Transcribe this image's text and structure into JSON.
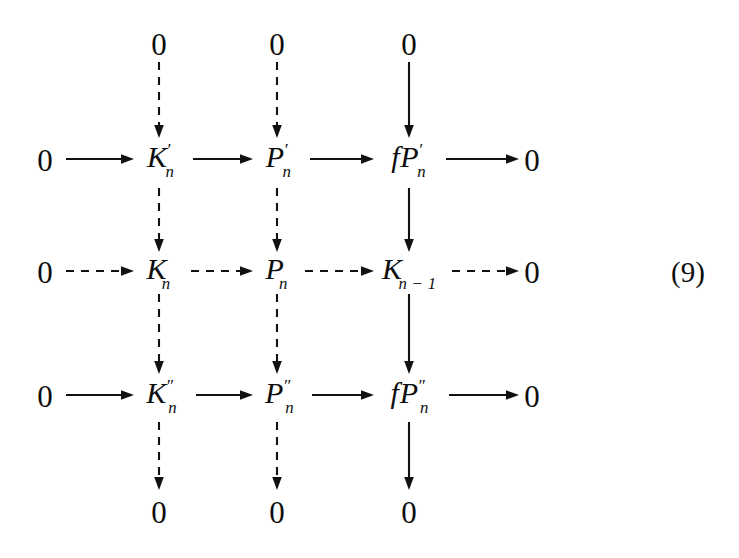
{
  "figure": {
    "kind": "commutative-diagram",
    "equation_tag": "(9)",
    "background_color": "#ffffff",
    "ink_color": "#111111",
    "width": 739,
    "height": 558
  },
  "columns": [
    {
      "id": "col-1",
      "x": 159
    },
    {
      "id": "col-2",
      "x": 277
    },
    {
      "id": "col-3",
      "x": 409
    }
  ],
  "rows": [
    {
      "id": "row-top-zero",
      "y": 44
    },
    {
      "id": "row-1",
      "y": 160,
      "arrow_style": "solid"
    },
    {
      "id": "row-2",
      "y": 272,
      "arrow_style": "dashed"
    },
    {
      "id": "row-3",
      "y": 396,
      "arrow_style": "solid"
    },
    {
      "id": "row-bottom-zero",
      "y": 512
    }
  ],
  "nodes": {
    "top_zeros": [
      {
        "label": "0",
        "col": 0
      },
      {
        "label": "0",
        "col": 1
      },
      {
        "label": "0",
        "col": 2
      }
    ],
    "bottom_zeros": [
      {
        "label": "0",
        "col": 0
      },
      {
        "label": "0",
        "col": 1
      },
      {
        "label": "0",
        "col": 2
      }
    ],
    "row1": {
      "left_zero": "0",
      "right_zero": "0",
      "terms": [
        {
          "base": "K",
          "sup": "′",
          "sub": "n"
        },
        {
          "base": "P",
          "sup": "′",
          "sub": "n"
        },
        {
          "prefix": "f",
          "base": "P",
          "sup": "′",
          "sub": "n"
        }
      ]
    },
    "row2": {
      "left_zero": "0",
      "right_zero": "0",
      "terms": [
        {
          "base": "K",
          "sup": "",
          "sub": "n"
        },
        {
          "base": "P",
          "sup": "",
          "sub": "n"
        },
        {
          "base": "K",
          "sup": "",
          "sub": "n − 1"
        }
      ]
    },
    "row3": {
      "left_zero": "0",
      "right_zero": "0",
      "terms": [
        {
          "base": "K",
          "sup": "″",
          "sub": "n"
        },
        {
          "base": "P",
          "sup": "″",
          "sub": "n"
        },
        {
          "prefix": "f",
          "base": "P",
          "sup": "″",
          "sub": "n"
        }
      ]
    }
  },
  "edges": {
    "horizontal": [
      {
        "id": "r1-e1",
        "row": 1,
        "from": "0",
        "to": "K'n",
        "style": "solid"
      },
      {
        "id": "r1-e2",
        "row": 1,
        "from": "K'n",
        "to": "P'n",
        "style": "solid"
      },
      {
        "id": "r1-e3",
        "row": 1,
        "from": "P'n",
        "to": "fP'n",
        "style": "solid"
      },
      {
        "id": "r1-e4",
        "row": 1,
        "from": "fP'n",
        "to": "0",
        "style": "solid"
      },
      {
        "id": "r2-e1",
        "row": 2,
        "from": "0",
        "to": "Kn",
        "style": "dashed"
      },
      {
        "id": "r2-e2",
        "row": 2,
        "from": "Kn",
        "to": "Pn",
        "style": "dashed"
      },
      {
        "id": "r2-e3",
        "row": 2,
        "from": "Pn",
        "to": "Kn-1",
        "style": "dashed"
      },
      {
        "id": "r2-e4",
        "row": 2,
        "from": "Kn-1",
        "to": "0",
        "style": "dashed"
      },
      {
        "id": "r3-e1",
        "row": 3,
        "from": "0",
        "to": "K''n",
        "style": "solid"
      },
      {
        "id": "r3-e2",
        "row": 3,
        "from": "K''n",
        "to": "P''n",
        "style": "solid"
      },
      {
        "id": "r3-e3",
        "row": 3,
        "from": "P''n",
        "to": "fP''n",
        "style": "solid"
      },
      {
        "id": "r3-e4",
        "row": 3,
        "from": "fP''n",
        "to": "0",
        "style": "solid"
      }
    ],
    "vertical": [
      {
        "id": "c1-e1",
        "col": 1,
        "from": "0",
        "to": "K'n",
        "style": "dashed"
      },
      {
        "id": "c1-e2",
        "col": 1,
        "from": "K'n",
        "to": "Kn",
        "style": "dashed"
      },
      {
        "id": "c1-e3",
        "col": 1,
        "from": "Kn",
        "to": "K''n",
        "style": "dashed"
      },
      {
        "id": "c1-e4",
        "col": 1,
        "from": "K''n",
        "to": "0",
        "style": "dashed"
      },
      {
        "id": "c2-e1",
        "col": 2,
        "from": "0",
        "to": "P'n",
        "style": "dashed"
      },
      {
        "id": "c2-e2",
        "col": 2,
        "from": "P'n",
        "to": "Pn",
        "style": "dashed"
      },
      {
        "id": "c2-e3",
        "col": 2,
        "from": "Pn",
        "to": "P''n",
        "style": "dashed"
      },
      {
        "id": "c2-e4",
        "col": 2,
        "from": "P''n",
        "to": "0",
        "style": "dashed"
      },
      {
        "id": "c3-e1",
        "col": 3,
        "from": "0",
        "to": "fP'n",
        "style": "solid"
      },
      {
        "id": "c3-e2",
        "col": 3,
        "from": "fP'n",
        "to": "Kn-1",
        "style": "solid"
      },
      {
        "id": "c3-e3",
        "col": 3,
        "from": "Kn-1",
        "to": "fP''n",
        "style": "solid"
      },
      {
        "id": "c3-e4",
        "col": 3,
        "from": "fP''n",
        "to": "0",
        "style": "solid"
      }
    ]
  },
  "side_zeros": {
    "left_x": 45,
    "right_x": 532
  }
}
